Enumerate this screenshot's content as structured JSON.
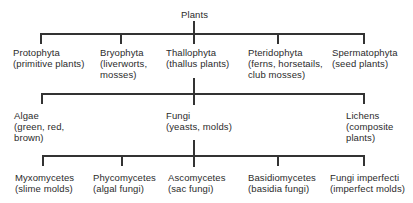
{
  "diagram": {
    "root": {
      "label": "Plants"
    },
    "level1": [
      {
        "label": "Protophyta",
        "sub": [
          "(primitive plants)"
        ]
      },
      {
        "label": "Bryophyta",
        "sub": [
          "(liverworts,",
          "mosses)"
        ]
      },
      {
        "label": "Thallophyta",
        "sub": [
          "(thallus plants)"
        ]
      },
      {
        "label": "Pteridophyta",
        "sub": [
          "(ferns, horsetails,",
          "club mosses)"
        ]
      },
      {
        "label": "Spermatophyta",
        "sub": [
          "(seed plants)"
        ]
      }
    ],
    "level2": [
      {
        "label": "Algae",
        "sub": [
          "(green, red,",
          "brown)"
        ]
      },
      {
        "label": "Fungi",
        "sub": [
          "(yeasts, molds)"
        ]
      },
      {
        "label": "Lichens",
        "sub": [
          "(composite",
          "plants)"
        ]
      }
    ],
    "level3": [
      {
        "label": "Myxomycetes",
        "sub": [
          "(slime molds)"
        ]
      },
      {
        "label": "Phycomycetes",
        "sub": [
          "(algal fungi)"
        ]
      },
      {
        "label": "Ascomycetes",
        "sub": [
          "(sac fungi)"
        ]
      },
      {
        "label": "Basidiomycetes",
        "sub": [
          "(basidia fungi)"
        ]
      },
      {
        "label": "Fungi imperfecti",
        "sub": [
          "(imperfect molds)"
        ]
      }
    ]
  },
  "colors": {
    "line": "#333333",
    "text": "#2b2b2b",
    "background": "#ffffff"
  }
}
